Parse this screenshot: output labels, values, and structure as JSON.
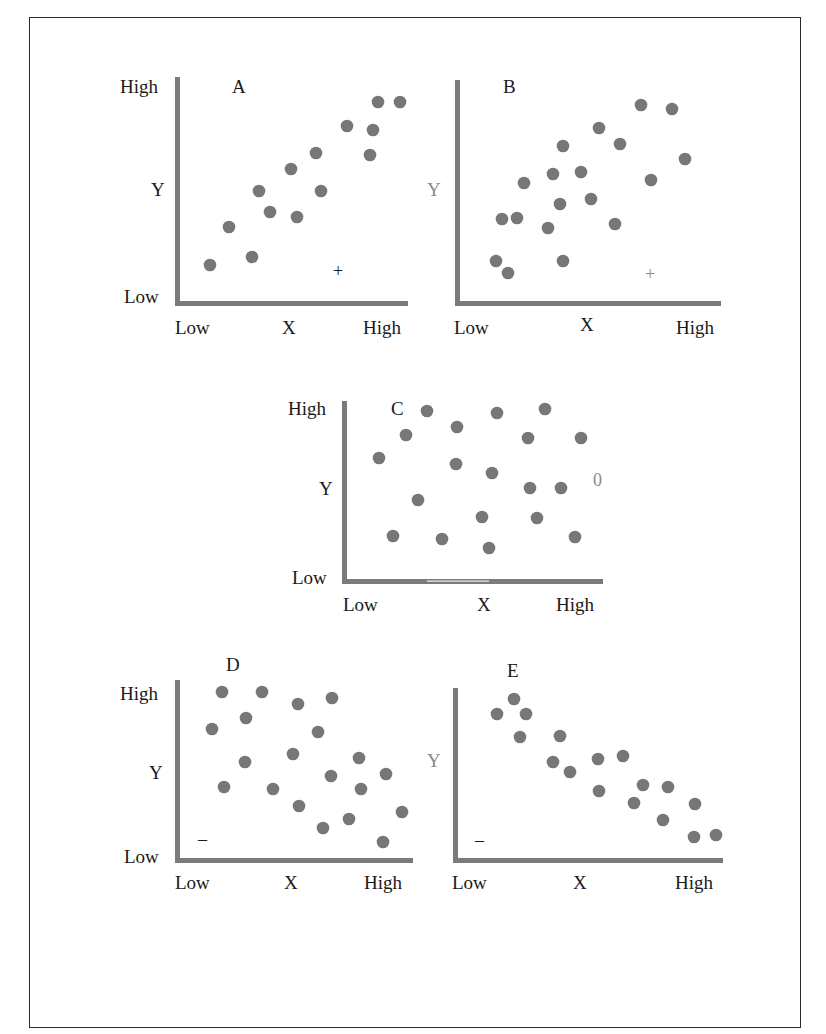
{
  "colors": {
    "axis": "#7b7b7b",
    "dot": "#777777",
    "text": "#1a1a1a",
    "muted_text": "#8a8a8a",
    "frame": "#2a2a2a"
  },
  "chart_data": [
    {
      "type": "scatter",
      "title": "A",
      "correlation_sign": "+",
      "xlabel": "X",
      "ylabel": "Y",
      "x_ticks": [
        "Low",
        "High"
      ],
      "y_ticks": [
        "Low",
        "High"
      ],
      "grid": false,
      "axes_px": {
        "x0": 175,
        "y0": 304,
        "x1": 408,
        "y1": 77
      },
      "sign_px": [
        339,
        271
      ],
      "points_px": [
        [
          210,
          265
        ],
        [
          229,
          227
        ],
        [
          252,
          257
        ],
        [
          259,
          191
        ],
        [
          270,
          212
        ],
        [
          291,
          169
        ],
        [
          297,
          217
        ],
        [
          316,
          153
        ],
        [
          321,
          191
        ],
        [
          347,
          126
        ],
        [
          373,
          130
        ],
        [
          370,
          155
        ],
        [
          378,
          102
        ],
        [
          400,
          102
        ]
      ]
    },
    {
      "type": "scatter",
      "title": "B",
      "correlation_sign": "+",
      "xlabel": "X",
      "ylabel": "Y",
      "x_ticks": [
        "Low",
        "High"
      ],
      "y_ticks": [],
      "grid": false,
      "axes_px": {
        "x0": 455,
        "y0": 304,
        "x1": 720,
        "y1": 80
      },
      "sign_px": [
        651,
        274
      ],
      "points_px": [
        [
          496,
          261
        ],
        [
          508,
          273
        ],
        [
          502,
          219
        ],
        [
          517,
          218
        ],
        [
          524,
          183
        ],
        [
          548,
          228
        ],
        [
          553,
          174
        ],
        [
          560,
          204
        ],
        [
          563,
          146
        ],
        [
          563,
          261
        ],
        [
          581,
          172
        ],
        [
          591,
          199
        ],
        [
          599,
          128
        ],
        [
          615,
          224
        ],
        [
          620,
          144
        ],
        [
          641,
          105
        ],
        [
          651,
          180
        ],
        [
          672,
          109
        ],
        [
          685,
          159
        ]
      ]
    },
    {
      "type": "scatter",
      "title": "C",
      "correlation_sign": "0",
      "xlabel": "X",
      "ylabel": "Y",
      "x_ticks": [
        "Low",
        "High"
      ],
      "y_ticks": [
        "Low",
        "High"
      ],
      "grid": false,
      "axes_px": {
        "x0": 344,
        "y0": 580,
        "x1": 602,
        "y1": 400
      },
      "sign_px": [
        598,
        479
      ],
      "points_px": [
        [
          427,
          411
        ],
        [
          406,
          435
        ],
        [
          379,
          458
        ],
        [
          457,
          427
        ],
        [
          456,
          464
        ],
        [
          418,
          500
        ],
        [
          393,
          536
        ],
        [
          442,
          539
        ],
        [
          497,
          413
        ],
        [
          492,
          473
        ],
        [
          482,
          517
        ],
        [
          489,
          548
        ],
        [
          545,
          409
        ],
        [
          528,
          438
        ],
        [
          530,
          488
        ],
        [
          561,
          488
        ],
        [
          537,
          518
        ],
        [
          581,
          438
        ],
        [
          575,
          537
        ]
      ]
    },
    {
      "type": "scatter",
      "title": "D",
      "correlation_sign": "-",
      "xlabel": "X",
      "ylabel": "Y",
      "x_ticks": [
        "Low",
        "High"
      ],
      "y_ticks": [
        "Low",
        "High"
      ],
      "grid": false,
      "axes_px": {
        "x0": 177,
        "y0": 860,
        "x1": 412,
        "y1": 680
      },
      "sign_px": [
        204,
        839
      ],
      "points_px": [
        [
          222,
          692
        ],
        [
          262,
          692
        ],
        [
          212,
          729
        ],
        [
          246,
          718
        ],
        [
          245,
          762
        ],
        [
          224,
          787
        ],
        [
          298,
          704
        ],
        [
          332,
          698
        ],
        [
          318,
          732
        ],
        [
          293,
          754
        ],
        [
          273,
          789
        ],
        [
          299,
          806
        ],
        [
          323,
          828
        ],
        [
          331,
          776
        ],
        [
          359,
          758
        ],
        [
          361,
          789
        ],
        [
          349,
          819
        ],
        [
          386,
          774
        ],
        [
          402,
          812
        ],
        [
          383,
          842
        ]
      ]
    },
    {
      "type": "scatter",
      "title": "E",
      "correlation_sign": "-",
      "xlabel": "X",
      "ylabel": "Y",
      "x_ticks": [
        "Low",
        "High"
      ],
      "y_ticks": [],
      "grid": false,
      "axes_px": {
        "x0": 455,
        "y0": 860,
        "x1": 722,
        "y1": 688
      },
      "sign_px": [
        481,
        840
      ],
      "points_px": [
        [
          497,
          714
        ],
        [
          514,
          699
        ],
        [
          526,
          714
        ],
        [
          520,
          737
        ],
        [
          560,
          736
        ],
        [
          553,
          762
        ],
        [
          570,
          772
        ],
        [
          598,
          759
        ],
        [
          599,
          791
        ],
        [
          623,
          756
        ],
        [
          643,
          785
        ],
        [
          634,
          803
        ],
        [
          668,
          787
        ],
        [
          663,
          820
        ],
        [
          695,
          804
        ],
        [
          694,
          837
        ],
        [
          716,
          835
        ]
      ]
    }
  ],
  "labels": {
    "A": {
      "title": "A",
      "y_high": "High",
      "y_low": "Low",
      "y": "Y",
      "x_low": "Low",
      "x": "X",
      "x_high": "High",
      "sign": "+"
    },
    "B": {
      "title": "B",
      "y": "Y",
      "x_low": "Low",
      "x": "X",
      "x_high": "High",
      "sign": "+"
    },
    "C": {
      "title": "C",
      "y_high": "High",
      "y_low": "Low",
      "y": "Y",
      "x_low": "Low",
      "x": "X",
      "x_high": "High",
      "sign": "0"
    },
    "D": {
      "title": "D",
      "y_high": "High",
      "y_low": "Low",
      "y": "Y",
      "x_low": "Low",
      "x": "X",
      "x_high": "High",
      "sign": "–"
    },
    "E": {
      "title": "E",
      "y": "Y",
      "x_low": "Low",
      "x": "X",
      "x_high": "High",
      "sign": "–"
    }
  }
}
